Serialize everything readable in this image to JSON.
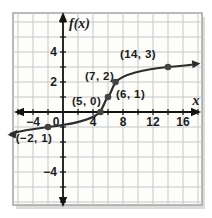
{
  "figure": {
    "background": "#ffffff",
    "plot_background": "#fdfdfa",
    "frame_color": "#9ea4a6",
    "grid_color": "#c5c9ca",
    "axis_color": "#141414",
    "curve_color": "#2d2d2d",
    "point_color": "#434343",
    "text_color": "#1c1c1c"
  },
  "chart_data": {
    "type": "line",
    "title": "",
    "xlabel": "x",
    "ylabel": "f(x)",
    "xlim": [
      -7,
      18
    ],
    "ylim": [
      -6.5,
      6.5
    ],
    "grid": "on",
    "x_gridline_step": 2,
    "y_gridline_step": 1,
    "x_ticks": [
      {
        "value": -4,
        "label": "−4"
      },
      {
        "value": 0,
        "label": "0"
      },
      {
        "value": 4,
        "label": "4"
      },
      {
        "value": 8,
        "label": "8"
      },
      {
        "value": 12,
        "label": "12"
      },
      {
        "value": 16,
        "label": "16"
      }
    ],
    "y_ticks": [
      {
        "value": 4,
        "label": "4"
      },
      {
        "value": 2,
        "label": "2"
      },
      {
        "value": -4,
        "label": "−4"
      }
    ],
    "points": [
      {
        "x": -2,
        "y": -1,
        "label": "(−2, 1)"
      },
      {
        "x": 5,
        "y": 0,
        "label": "(5, 0)"
      },
      {
        "x": 6,
        "y": 1,
        "label": "(6, 1)"
      },
      {
        "x": 7,
        "y": 2,
        "label": "(7, 2)"
      },
      {
        "x": 14,
        "y": 3,
        "label": "(14, 3)"
      }
    ],
    "curve_description": "increasing S-shaped (cube-root-like) curve through the labeled points, arrows on both ends"
  }
}
